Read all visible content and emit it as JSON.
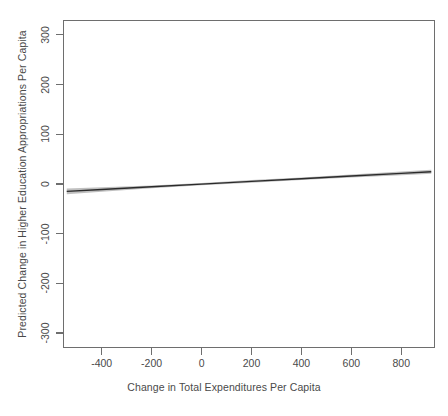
{
  "chart_data": {
    "type": "line",
    "title": "",
    "subtitle": "",
    "xlabel": "Change in Total Expenditures Per Capita",
    "ylabel": "Predicted Change in Higher Education Appropriations Per Capita",
    "xlim": [
      -555,
      935
    ],
    "ylim": [
      -330,
      330
    ],
    "xticks": [
      -400,
      -200,
      0,
      200,
      400,
      600,
      800
    ],
    "xtick_labels": [
      "-400",
      "-200",
      "0",
      "200",
      "400",
      "600",
      "800"
    ],
    "yticks": [
      -300,
      -200,
      -100,
      0,
      100,
      200,
      300
    ],
    "ytick_labels": [
      "-300",
      "-200",
      "-100",
      "0",
      "100",
      "200",
      "300"
    ],
    "grid": false,
    "legend": null,
    "legend_position": "none",
    "frame": true,
    "series": [
      {
        "name": "Predicted change (fitted line)",
        "type": "line",
        "color": "#2b2b2b",
        "linewidth": 1.4,
        "x": [
          -540,
          -400,
          -200,
          0,
          200,
          400,
          600,
          800,
          920
        ],
        "values": [
          -14.8,
          -11.0,
          -5.6,
          -0.2,
          5.2,
          10.6,
          16.0,
          21.4,
          24.6
        ]
      },
      {
        "name": "Confidence band",
        "type": "band",
        "color": "#8c8c8c",
        "opacity": 0.55,
        "x": [
          -540,
          -400,
          -200,
          0,
          200,
          400,
          600,
          800,
          920
        ],
        "lower": [
          -20.5,
          -15.5,
          -8.4,
          -2.6,
          2.6,
          8.0,
          12.9,
          17.6,
          20.4
        ],
        "upper": [
          -9.1,
          -6.5,
          -2.8,
          2.2,
          7.8,
          13.2,
          19.1,
          25.2,
          28.8
        ]
      }
    ],
    "annotations": []
  }
}
